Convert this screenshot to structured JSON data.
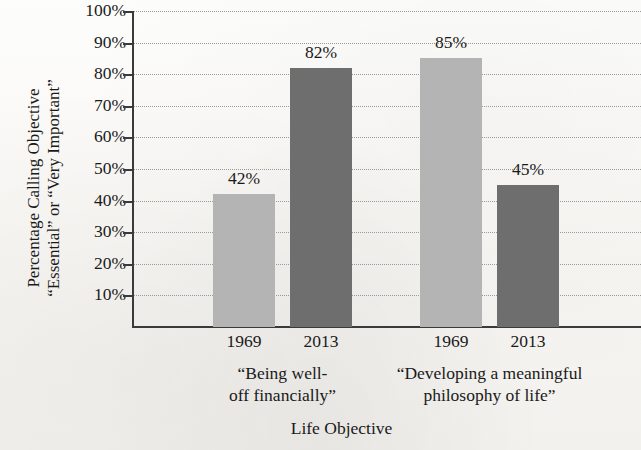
{
  "chart_data": {
    "type": "bar",
    "title": "",
    "xlabel": "Life Objective",
    "ylabel_line1": "Percentage Calling Objective",
    "ylabel_line2": "“Essential” or “Very Important”",
    "ylim": [
      0,
      100
    ],
    "ytick_labels": [
      "100%",
      "90%",
      "80%",
      "70%",
      "60%",
      "50%",
      "40%",
      "30%",
      "20%",
      "10%"
    ],
    "ytick_values": [
      100,
      90,
      80,
      70,
      60,
      50,
      40,
      30,
      20,
      10
    ],
    "grid": true,
    "legend": "none",
    "categories": [
      {
        "line1": "“Being well-",
        "line2": "off financially”"
      },
      {
        "line1": "“Developing a meaningful",
        "line2": "philosophy of life”"
      }
    ],
    "series": [
      {
        "name": "1969",
        "values": [
          42,
          85
        ],
        "color": "#b4b4b4"
      },
      {
        "name": "2013",
        "values": [
          82,
          45
        ],
        "color": "#6e6e6e"
      }
    ],
    "bars": [
      {
        "group": 0,
        "series": "1969",
        "value": 42,
        "label": "42%",
        "tick": "1969",
        "color": "#b4b4b4"
      },
      {
        "group": 0,
        "series": "2013",
        "value": 82,
        "label": "82%",
        "tick": "2013",
        "color": "#6e6e6e"
      },
      {
        "group": 1,
        "series": "1969",
        "value": 85,
        "label": "85%",
        "tick": "1969",
        "color": "#b4b4b4"
      },
      {
        "group": 1,
        "series": "2013",
        "value": 45,
        "label": "45%",
        "tick": "2013",
        "color": "#6e6e6e"
      }
    ]
  },
  "colors": {
    "bar_1969": "#b4b4b4",
    "bar_2013": "#6e6e6e",
    "axis": "#3a3a3a",
    "gridline": "#9a9a9a",
    "background": "#fbfaf8",
    "text": "#1a1a1a"
  }
}
